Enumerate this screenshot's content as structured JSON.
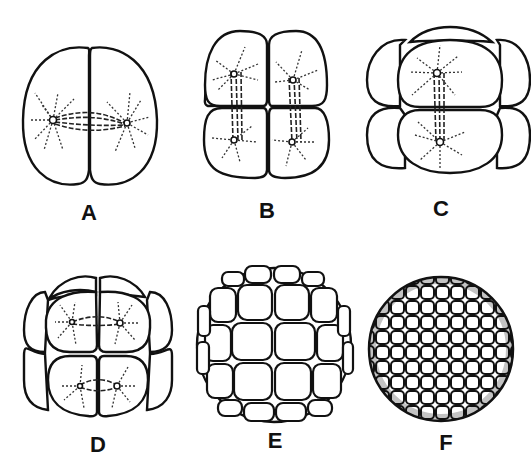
{
  "figure": {
    "panels": [
      {
        "id": "A",
        "label": "A",
        "description": "2-cell stage with mitotic spindles"
      },
      {
        "id": "B",
        "label": "B",
        "description": "4-cell stage with mitotic spindles"
      },
      {
        "id": "C",
        "label": "C",
        "description": "8-cell stage with mitotic spindle"
      },
      {
        "id": "D",
        "label": "D",
        "description": "16-cell stage with mitotic spindles"
      },
      {
        "id": "E",
        "label": "E",
        "description": "32-cell stage (morula)"
      },
      {
        "id": "F",
        "label": "F",
        "description": "many-cell stage (blastula)"
      }
    ]
  }
}
